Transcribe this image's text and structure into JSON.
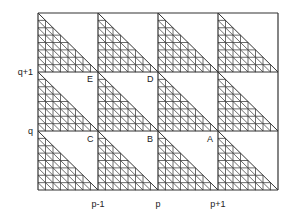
{
  "diagram": {
    "grid": {
      "cols": 4,
      "rows": 3,
      "left": 38,
      "top": 13,
      "right": 278,
      "bottom": 190,
      "subdivisions": 8,
      "line_color": "#333333",
      "hatch_color": "#444444"
    },
    "y_axis_labels": [
      {
        "text": "q+1",
        "y": 72
      },
      {
        "text": "q",
        "y": 131
      }
    ],
    "x_axis_labels": [
      {
        "text": "p-1",
        "x": 98
      },
      {
        "text": "p",
        "x": 158
      },
      {
        "text": "p+1",
        "x": 218
      }
    ],
    "points": [
      {
        "name": "E",
        "x": 90,
        "y": 79
      },
      {
        "name": "D",
        "x": 150,
        "y": 79
      },
      {
        "name": "C",
        "x": 90,
        "y": 139
      },
      {
        "name": "B",
        "x": 150,
        "y": 139
      },
      {
        "name": "A",
        "x": 210,
        "y": 139
      }
    ]
  }
}
